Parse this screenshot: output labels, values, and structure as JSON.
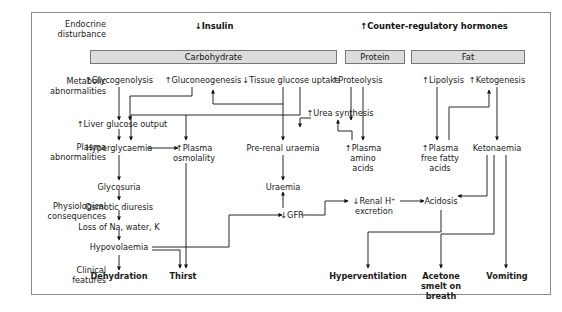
{
  "diagram": {
    "frame_color": "#8a8a8a",
    "box_fill": "#dcdcdc",
    "text_color": "#1a1a1a"
  },
  "row_labels": [
    {
      "id": "endocrine",
      "line1": "Endocrine",
      "line2": "disturbance"
    },
    {
      "id": "metabolic",
      "line1": "Metabolic",
      "line2": "abnormalities"
    },
    {
      "id": "plasma",
      "line1": "Plasma",
      "line2": "abnormalities"
    },
    {
      "id": "physiological",
      "line1": "Physiological",
      "line2": "consequences"
    },
    {
      "id": "clinical",
      "line1": "Clinical",
      "line2": "features"
    }
  ],
  "headers": [
    {
      "id": "insulin",
      "text": "↓Insulin"
    },
    {
      "id": "counter-regulatory",
      "text": "↑Counter-regulatory hormones"
    }
  ],
  "category_boxes": [
    {
      "id": "carbohydrate",
      "label": "Carbohydrate"
    },
    {
      "id": "protein",
      "label": "Protein"
    },
    {
      "id": "fat",
      "label": "Fat"
    }
  ],
  "nodes": {
    "glycogenolysis": "↑Glycogenolysis",
    "gluconeogenesis": "↑Gluconeogenesis",
    "tissue_glucose_uptake": "↓Tissue glucose uptake",
    "proteolysis": "↑Proteolysis",
    "lipolysis": "↑Lipolysis",
    "ketogenesis": "↑Ketogenesis",
    "liver_glucose_output": "↑Liver glucose output",
    "urea_synthesis": "↑Urea synthesis",
    "hyperglycaemia": "Hyperglycaemia",
    "plasma_osmolality": "↑Plasma osmolality",
    "pre_renal_uraemia": "Pre-renal uraemia",
    "plasma_amino_acids": "↑Plasma amino acids",
    "plasma_free_fatty_acids": "↑Plasma free fatty acids",
    "ketonaemia": "Ketonaemia",
    "glycosuria": "Glycosuria",
    "uraemia": "Uraemia",
    "osmotic_diuresis": "Osmotic diuresis",
    "loss_of_na_water_k": "Loss of Na, water, K",
    "gfr": "↓GFR",
    "renal_h_excretion": "↓Renal H⁺ excretion",
    "acidosis": "Acidosis",
    "hypovolaemia": "Hypovolaemia",
    "dehydration": "Dehydration",
    "thirst": "Thirst",
    "hyperventilation": "Hyperventilation",
    "acetone_smelt_on_breath": "Acetone smelt on breath",
    "vomiting": "Vomiting"
  }
}
